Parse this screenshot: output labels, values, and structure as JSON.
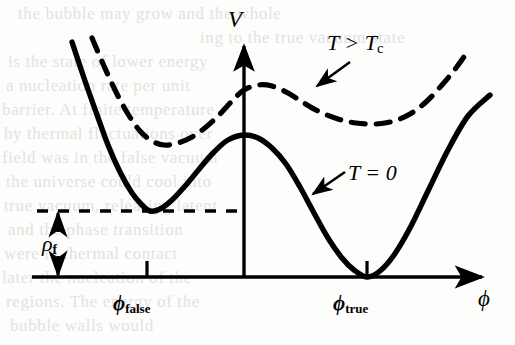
{
  "figure": {
    "kind": "effective-potential-plot",
    "axes": {
      "y_label": "V",
      "x_label": "ϕ",
      "x_axis_y": 277,
      "y_axis_x": 244,
      "x_axis_from": 32,
      "x_axis_to": 488,
      "y_axis_top": 40
    },
    "ticks": [
      {
        "name": "phi-false",
        "label_base": "ϕ",
        "label_sub": "false",
        "x": 147
      },
      {
        "name": "phi-true",
        "label_base": "ϕ",
        "label_sub": "true",
        "x": 367
      }
    ],
    "annotations": [
      {
        "name": "hot-curve-label",
        "text_base": "T > T",
        "text_sub": "c",
        "target": "dashed-curve"
      },
      {
        "name": "cold-curve-label",
        "text_base": "T = 0",
        "text_sub": "",
        "target": "solid-curve"
      },
      {
        "name": "energy-gap-label",
        "text_base": "ρ",
        "text_sub": "f",
        "target": "energy-gap-arrow"
      }
    ],
    "colors": {
      "ink": "#000000",
      "paper": "#fdfdfc",
      "bleed": "#e3e2e0"
    },
    "stroke": {
      "curve_width": 5.2,
      "axis_width": 3.4,
      "dash_pattern": "14 11",
      "level_dash_pattern": "11 10"
    }
  },
  "chart_data": {
    "type": "line",
    "title": "",
    "xlabel": "ϕ",
    "ylabel": "V",
    "grid": false,
    "legend": "inline-annotations",
    "xlim": [
      32,
      488
    ],
    "ylim_pixels_inverted": [
      277,
      40
    ],
    "series": [
      {
        "name": "T = 0",
        "style": "solid",
        "description": "Double-well effective potential at zero temperature: a shallow false-vacuum minimum on the left at ϕ_false sitting a height ρ_f above zero, a local maximum barrier at ϕ = 0, and the degenerate-breaking global true-vacuum minimum at ϕ_true touching V = 0.",
        "points": [
          [
            72,
            42
          ],
          [
            84,
            78
          ],
          [
            96,
            112
          ],
          [
            108,
            145
          ],
          [
            120,
            172
          ],
          [
            132,
            193
          ],
          [
            142,
            205
          ],
          [
            150,
            211
          ],
          [
            160,
            209
          ],
          [
            172,
            200
          ],
          [
            186,
            185
          ],
          [
            200,
            168
          ],
          [
            214,
            152
          ],
          [
            228,
            140
          ],
          [
            244,
            135
          ],
          [
            258,
            138
          ],
          [
            272,
            148
          ],
          [
            286,
            164
          ],
          [
            300,
            187
          ],
          [
            314,
            213
          ],
          [
            328,
            238
          ],
          [
            342,
            258
          ],
          [
            354,
            270
          ],
          [
            367,
            277
          ],
          [
            380,
            271
          ],
          [
            394,
            255
          ],
          [
            410,
            228
          ],
          [
            428,
            191
          ],
          [
            448,
            150
          ],
          [
            468,
            116
          ],
          [
            490,
            95
          ]
        ],
        "features": {
          "left_local_min": [
            150,
            211
          ],
          "barrier_max": [
            244,
            135
          ],
          "right_global_min": [
            367,
            277
          ]
        }
      },
      {
        "name": "T > T_c",
        "style": "dashed",
        "description": "Effective potential above the critical temperature: symmetry is restored, the curve is lifted and much flatter with only a shallow broad trough, no deep true vacuum.",
        "points": [
          [
            92,
            38
          ],
          [
            104,
            66
          ],
          [
            116,
            92
          ],
          [
            128,
            114
          ],
          [
            140,
            131
          ],
          [
            152,
            141
          ],
          [
            164,
            145
          ],
          [
            178,
            143
          ],
          [
            192,
            137
          ],
          [
            206,
            127
          ],
          [
            220,
            114
          ],
          [
            232,
            101
          ],
          [
            244,
            90
          ],
          [
            258,
            85
          ],
          [
            272,
            86
          ],
          [
            288,
            93
          ],
          [
            304,
            103
          ],
          [
            320,
            112
          ],
          [
            338,
            119
          ],
          [
            356,
            123
          ],
          [
            376,
            124
          ],
          [
            394,
            121
          ],
          [
            410,
            114
          ],
          [
            426,
            102
          ],
          [
            442,
            85
          ],
          [
            456,
            68
          ],
          [
            466,
            54
          ]
        ],
        "features": {
          "left_shallow_min": [
            166,
            145
          ],
          "central_bump": [
            262,
            85
          ],
          "right_shallow_min": [
            380,
            124
          ]
        }
      }
    ],
    "reference_lines": [
      {
        "name": "false-vacuum-level",
        "style": "dashed",
        "orientation": "horizontal",
        "y": 211,
        "from_x": 37,
        "to_x": 244,
        "meaning": "energy of the false vacuum, height ρ_f above V = 0"
      }
    ],
    "measure_arrows": [
      {
        "name": "energy-gap-arrow",
        "label_base": "ρ",
        "label_sub": "f",
        "x": 58,
        "from_y": 211,
        "to_y": 277,
        "double_headed": true
      }
    ]
  },
  "bleed_text": {
    "rows": [
      {
        "text": "the bubble may grow and the whole",
        "x": 18,
        "y": 4
      },
      {
        "text": "ing to the true vacuum state",
        "x": 200,
        "y": 28
      },
      {
        "text": "is the state of lower energy",
        "x": 8,
        "y": 52
      },
      {
        "text": "a nucleation rate per unit",
        "x": 6,
        "y": 76
      },
      {
        "text": "barrier. At finite temperature",
        "x": 2,
        "y": 100
      },
      {
        "text": "by thermal fluctuations over",
        "x": 4,
        "y": 124
      },
      {
        "text": "field was in the false vacuum",
        "x": 2,
        "y": 148
      },
      {
        "text": "the universe could cool into",
        "x": 6,
        "y": 172
      },
      {
        "text": "true vacuum, releasing latent",
        "x": 4,
        "y": 196
      },
      {
        "text": "and the phase transition",
        "x": 8,
        "y": 220
      },
      {
        "text": "were in thermal contact",
        "x": 4,
        "y": 244
      },
      {
        "text": "later the nucleation of the",
        "x": 2,
        "y": 268
      },
      {
        "text": "regions. The energy of the",
        "x": 6,
        "y": 292
      },
      {
        "text": "bubble walls would",
        "x": 10,
        "y": 316
      }
    ]
  }
}
